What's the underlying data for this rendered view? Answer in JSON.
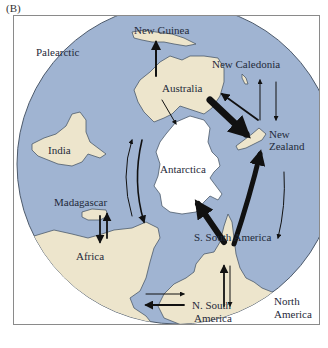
{
  "figure": {
    "panel_label": "(B)",
    "colors": {
      "ocean": "#a0b4d2",
      "land": "#ede5cc",
      "antarctica": "#ffffff",
      "coast": "#4d5a6b",
      "arrow": "#111111",
      "frame": "#8a8a8a"
    },
    "labels": {
      "palearctic": "Palearctic",
      "new_guinea": "New Guinea",
      "new_caledonia": "New Caledonia",
      "australia": "Australia",
      "new_zealand_1": "New",
      "new_zealand_2": "Zealand",
      "india": "India",
      "antarctica": "Antarctica",
      "madagascar": "Madagascar",
      "africa": "Africa",
      "s_south_america": "S. South America",
      "n_south_america_1": "N. South",
      "n_south_america_2": "America",
      "north_america_1": "North",
      "north_america_2": "America"
    },
    "dispersal_routes": [
      {
        "from": "Australia",
        "to": "New Guinea",
        "weight": "medium"
      },
      {
        "from": "Australia",
        "to": "Antarctica",
        "weight": "thin"
      },
      {
        "from": "Australia",
        "to": "New Zealand",
        "weight": "heavy"
      },
      {
        "from": "New Zealand",
        "to": "Australia",
        "weight": "medium"
      },
      {
        "from": "New Zealand",
        "to": "New Caledonia",
        "weight": "thin"
      },
      {
        "from": "New Caledonia",
        "to": "New Zealand",
        "weight": "thin"
      },
      {
        "from": "S. South America",
        "to": "New Zealand",
        "weight": "heavy"
      },
      {
        "from": "New Zealand",
        "to": "S. South America",
        "weight": "thin"
      },
      {
        "from": "S. South America",
        "to": "Antarctica",
        "weight": "heavy"
      },
      {
        "from": "N. South America",
        "to": "S. South America",
        "weight": "medium"
      },
      {
        "from": "S. South America",
        "to": "N. South America",
        "weight": "thin"
      },
      {
        "from": "Africa",
        "to": "N. South America",
        "weight": "thin"
      },
      {
        "from": "N. South America",
        "to": "Africa",
        "weight": "medium"
      },
      {
        "from": "Africa",
        "to": "Australia",
        "weight": "thin"
      },
      {
        "from": "Australia",
        "to": "Africa",
        "weight": "medium"
      },
      {
        "from": "Madagascar",
        "to": "Africa",
        "weight": "medium"
      },
      {
        "from": "Africa",
        "to": "Madagascar",
        "weight": "medium"
      }
    ]
  }
}
